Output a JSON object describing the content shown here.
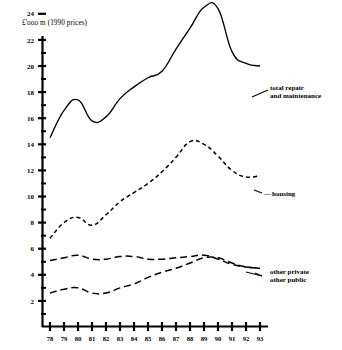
{
  "chart_data": {
    "type": "line",
    "title": "",
    "ylabel": "£'ooo m  (1990 prices)",
    "xlabel": "",
    "x": [
      "78",
      "79",
      "80",
      "81",
      "82",
      "83",
      "84",
      "85",
      "86",
      "87",
      "88",
      "89",
      "90",
      "91",
      "92",
      "93"
    ],
    "xlim": [
      78,
      93
    ],
    "ylim": [
      0,
      25.6
    ],
    "yticks": [
      2,
      4,
      6,
      8,
      10,
      12,
      14,
      16,
      18,
      20,
      22,
      24
    ],
    "yticklabels": [
      "2",
      "4",
      "6",
      "8",
      "10",
      "12",
      "14",
      "16",
      "18",
      "20",
      "22",
      "24"
    ],
    "minor_yticks": [
      1,
      3,
      5,
      7,
      9,
      11,
      13,
      15,
      17,
      19,
      21,
      23,
      25
    ],
    "grid": false,
    "legend": "inline-right-labels",
    "series": [
      {
        "name": "total repair and maintenance",
        "label_lines": [
          "total repair",
          "and maintenance"
        ],
        "style": "solid",
        "values": [
          14.5,
          16.6,
          17.4,
          15.8,
          16.1,
          17.5,
          18.4,
          19.1,
          19.6,
          21.3,
          22.9,
          24.5,
          24.4,
          21.1,
          20.2,
          20.0
        ]
      },
      {
        "name": "housing",
        "label_lines": [
          "housing"
        ],
        "style": "dashed-short",
        "values": [
          6.8,
          8.0,
          8.4,
          7.8,
          8.6,
          9.6,
          10.3,
          11.0,
          11.9,
          13.0,
          14.2,
          14.0,
          13.1,
          12.0,
          11.5,
          11.6
        ]
      },
      {
        "name": "other private",
        "label_lines": [
          "other private"
        ],
        "style": "dashed-long",
        "values": [
          5.1,
          5.3,
          5.5,
          5.2,
          5.2,
          5.4,
          5.4,
          5.2,
          5.2,
          5.3,
          5.4,
          5.5,
          5.2,
          4.8,
          4.6,
          4.5
        ]
      },
      {
        "name": "other public",
        "label_lines": [
          "other public"
        ],
        "style": "dashed-long",
        "values": [
          2.6,
          2.9,
          3.0,
          2.6,
          2.6,
          3.0,
          3.3,
          3.8,
          4.2,
          4.5,
          4.9,
          5.3,
          5.3,
          4.9,
          4.6,
          4.5
        ]
      }
    ]
  },
  "axis": {
    "y_title": "£'ooo m  (1990 prices)"
  },
  "labels": {
    "total_line1": "total repair",
    "total_line2": "and maintenance",
    "housing": "housing",
    "other_private": "other private",
    "other_public": "other public",
    "housing_dash_marker": "—"
  }
}
